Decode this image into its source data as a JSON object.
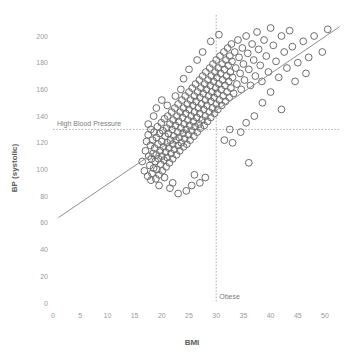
{
  "chart_data": {
    "type": "scatter",
    "title": "",
    "xlabel": "BMI",
    "ylabel": "BP (systolic)",
    "xlim": [
      0,
      52.5
    ],
    "ylim": [
      0,
      212
    ],
    "grid": false,
    "legend": "none",
    "xticks": [
      0,
      5,
      10,
      15,
      20,
      25,
      30,
      35,
      40,
      45,
      50
    ],
    "yticks": [
      0,
      20,
      40,
      60,
      80,
      100,
      120,
      140,
      160,
      180,
      200
    ],
    "point_style": {
      "marker": "open-circle",
      "radius": 3.4,
      "color": "#6e6e6e"
    },
    "annotations": [
      {
        "name": "high-blood-pressure",
        "label": "High Blood Pressure",
        "orientation": "horizontal",
        "value": 130,
        "style": "dashed"
      },
      {
        "name": "obese",
        "label": "Obese",
        "orientation": "vertical",
        "value": 30,
        "style": "dashed"
      }
    ],
    "trendline": {
      "x": [
        1.0,
        52.7
      ],
      "y": [
        64,
        207
      ],
      "color": "#8f8f8f"
    },
    "series": [
      {
        "name": "patients",
        "points": [
          [
            16.4,
            106
          ],
          [
            16.8,
            99
          ],
          [
            17.0,
            114
          ],
          [
            17.2,
            121
          ],
          [
            17.4,
            95
          ],
          [
            17.5,
            126
          ],
          [
            17.6,
            110
          ],
          [
            17.8,
            103
          ],
          [
            17.9,
            118
          ],
          [
            18.0,
            130
          ],
          [
            18.1,
            108
          ],
          [
            18.2,
            97
          ],
          [
            18.3,
            122
          ],
          [
            18.4,
            112
          ],
          [
            18.5,
            101
          ],
          [
            18.6,
            128
          ],
          [
            18.7,
            116
          ],
          [
            18.8,
            106
          ],
          [
            18.9,
            93
          ],
          [
            19.0,
            124
          ],
          [
            19.0,
            111
          ],
          [
            19.1,
            100
          ],
          [
            19.2,
            132
          ],
          [
            19.3,
            119
          ],
          [
            19.4,
            108
          ],
          [
            19.5,
            96
          ],
          [
            19.6,
            127
          ],
          [
            19.7,
            114
          ],
          [
            19.8,
            104
          ],
          [
            19.9,
            135
          ],
          [
            20.0,
            121
          ],
          [
            20.0,
            110
          ],
          [
            20.1,
            99
          ],
          [
            20.2,
            129
          ],
          [
            20.3,
            117
          ],
          [
            20.4,
            107
          ],
          [
            20.5,
            138
          ],
          [
            20.6,
            125
          ],
          [
            20.7,
            113
          ],
          [
            20.8,
            102
          ],
          [
            20.9,
            131
          ],
          [
            21.0,
            120
          ],
          [
            21.0,
            109
          ],
          [
            21.1,
            140
          ],
          [
            21.2,
            127
          ],
          [
            21.3,
            116
          ],
          [
            21.4,
            105
          ],
          [
            21.5,
            134
          ],
          [
            21.6,
            122
          ],
          [
            21.7,
            112
          ],
          [
            21.8,
            143
          ],
          [
            21.9,
            130
          ],
          [
            22.0,
            119
          ],
          [
            22.0,
            108
          ],
          [
            22.1,
            137
          ],
          [
            22.2,
            125
          ],
          [
            22.3,
            115
          ],
          [
            22.4,
            146
          ],
          [
            22.5,
            133
          ],
          [
            22.6,
            122
          ],
          [
            22.7,
            111
          ],
          [
            22.8,
            140
          ],
          [
            22.9,
            128
          ],
          [
            23.0,
            118
          ],
          [
            23.0,
            149
          ],
          [
            23.1,
            136
          ],
          [
            23.2,
            124
          ],
          [
            23.3,
            114
          ],
          [
            23.4,
            143
          ],
          [
            23.5,
            131
          ],
          [
            23.6,
            120
          ],
          [
            23.7,
            152
          ],
          [
            23.8,
            139
          ],
          [
            23.9,
            127
          ],
          [
            24.0,
            117
          ],
          [
            24.0,
            146
          ],
          [
            24.1,
            134
          ],
          [
            24.2,
            123
          ],
          [
            24.3,
            155
          ],
          [
            24.4,
            142
          ],
          [
            24.5,
            130
          ],
          [
            24.6,
            119
          ],
          [
            24.7,
            149
          ],
          [
            24.8,
            137
          ],
          [
            24.9,
            126
          ],
          [
            25.0,
            158
          ],
          [
            25.0,
            145
          ],
          [
            25.1,
            133
          ],
          [
            25.2,
            122
          ],
          [
            25.3,
            152
          ],
          [
            25.4,
            140
          ],
          [
            25.5,
            129
          ],
          [
            25.6,
            161
          ],
          [
            25.7,
            148
          ],
          [
            25.8,
            136
          ],
          [
            25.9,
            125
          ],
          [
            26.0,
            155
          ],
          [
            26.0,
            143
          ],
          [
            26.1,
            132
          ],
          [
            26.2,
            164
          ],
          [
            26.3,
            151
          ],
          [
            26.4,
            139
          ],
          [
            26.5,
            128
          ],
          [
            26.6,
            158
          ],
          [
            26.7,
            146
          ],
          [
            26.8,
            134
          ],
          [
            26.9,
            167
          ],
          [
            27.0,
            154
          ],
          [
            27.0,
            142
          ],
          [
            27.1,
            131
          ],
          [
            27.2,
            161
          ],
          [
            27.3,
            149
          ],
          [
            27.4,
            137
          ],
          [
            27.5,
            170
          ],
          [
            27.6,
            157
          ],
          [
            27.7,
            145
          ],
          [
            27.8,
            133
          ],
          [
            27.9,
            164
          ],
          [
            28.0,
            152
          ],
          [
            28.0,
            140
          ],
          [
            28.1,
            173
          ],
          [
            28.2,
            160
          ],
          [
            28.3,
            148
          ],
          [
            28.4,
            136
          ],
          [
            28.5,
            167
          ],
          [
            28.6,
            155
          ],
          [
            28.7,
            143
          ],
          [
            28.8,
            176
          ],
          [
            28.9,
            163
          ],
          [
            29.0,
            151
          ],
          [
            29.0,
            139
          ],
          [
            29.1,
            170
          ],
          [
            29.2,
            158
          ],
          [
            29.3,
            146
          ],
          [
            29.4,
            179
          ],
          [
            29.5,
            166
          ],
          [
            29.6,
            154
          ],
          [
            29.7,
            142
          ],
          [
            29.8,
            173
          ],
          [
            29.9,
            161
          ],
          [
            30.0,
            149
          ],
          [
            30.0,
            182
          ],
          [
            30.1,
            169
          ],
          [
            30.2,
            157
          ],
          [
            30.3,
            145
          ],
          [
            30.4,
            176
          ],
          [
            30.5,
            164
          ],
          [
            30.6,
            152
          ],
          [
            30.7,
            185
          ],
          [
            30.8,
            172
          ],
          [
            30.9,
            160
          ],
          [
            31.0,
            148
          ],
          [
            31.1,
            179
          ],
          [
            31.2,
            167
          ],
          [
            31.3,
            155
          ],
          [
            31.4,
            188
          ],
          [
            31.5,
            175
          ],
          [
            31.6,
            163
          ],
          [
            31.7,
            151
          ],
          [
            31.8,
            182
          ],
          [
            31.9,
            170
          ],
          [
            32.0,
            158
          ],
          [
            32.1,
            191
          ],
          [
            32.2,
            178
          ],
          [
            32.3,
            166
          ],
          [
            32.4,
            154
          ],
          [
            32.5,
            185
          ],
          [
            32.6,
            173
          ],
          [
            32.7,
            161
          ],
          [
            32.8,
            194
          ],
          [
            32.9,
            181
          ],
          [
            33.0,
            169
          ],
          [
            33.2,
            157
          ],
          [
            33.4,
            188
          ],
          [
            33.6,
            176
          ],
          [
            33.8,
            164
          ],
          [
            34.0,
            197
          ],
          [
            34.2,
            184
          ],
          [
            34.4,
            172
          ],
          [
            34.6,
            160
          ],
          [
            34.8,
            191
          ],
          [
            35.0,
            179
          ],
          [
            35.2,
            167
          ],
          [
            35.5,
            200
          ],
          [
            35.8,
            187
          ],
          [
            36.0,
            175
          ],
          [
            36.3,
            163
          ],
          [
            36.6,
            194
          ],
          [
            36.9,
            182
          ],
          [
            37.2,
            170
          ],
          [
            37.5,
            203
          ],
          [
            37.8,
            190
          ],
          [
            38.1,
            178
          ],
          [
            38.4,
            166
          ],
          [
            38.8,
            197
          ],
          [
            39.2,
            185
          ],
          [
            39.6,
            173
          ],
          [
            40.0,
            206
          ],
          [
            40.5,
            193
          ],
          [
            41.0,
            181
          ],
          [
            41.5,
            169
          ],
          [
            42.0,
            200
          ],
          [
            42.5,
            188
          ],
          [
            43.0,
            176
          ],
          [
            43.5,
            204
          ],
          [
            44.0,
            192
          ],
          [
            45.0,
            180
          ],
          [
            46.0,
            196
          ],
          [
            47.0,
            184
          ],
          [
            48.0,
            200
          ],
          [
            49.5,
            188
          ],
          [
            50.5,
            205
          ],
          [
            36.0,
            105
          ],
          [
            24.5,
            84
          ],
          [
            25.5,
            88
          ],
          [
            23.0,
            82
          ],
          [
            21.5,
            86
          ],
          [
            27.0,
            90
          ],
          [
            19.5,
            88
          ],
          [
            18.0,
            92
          ],
          [
            20.5,
            94
          ],
          [
            22.0,
            90
          ],
          [
            26.0,
            96
          ],
          [
            28.0,
            94
          ],
          [
            17.5,
            134
          ],
          [
            18.5,
            140
          ],
          [
            19.0,
            146
          ],
          [
            20.0,
            152
          ],
          [
            33.0,
            120
          ],
          [
            34.5,
            128
          ],
          [
            35.5,
            135
          ],
          [
            31.5,
            122
          ],
          [
            32.5,
            130
          ],
          [
            37.0,
            140
          ],
          [
            38.5,
            150
          ],
          [
            40.0,
            158
          ],
          [
            42.0,
            145
          ],
          [
            44.5,
            166
          ],
          [
            46.5,
            172
          ],
          [
            29.0,
            196
          ],
          [
            30.5,
            201
          ],
          [
            27.5,
            188
          ],
          [
            26.5,
            182
          ],
          [
            25.0,
            175
          ],
          [
            24.0,
            168
          ],
          [
            23.5,
            160
          ],
          [
            22.5,
            155
          ],
          [
            21.0,
            148
          ]
        ]
      }
    ]
  }
}
